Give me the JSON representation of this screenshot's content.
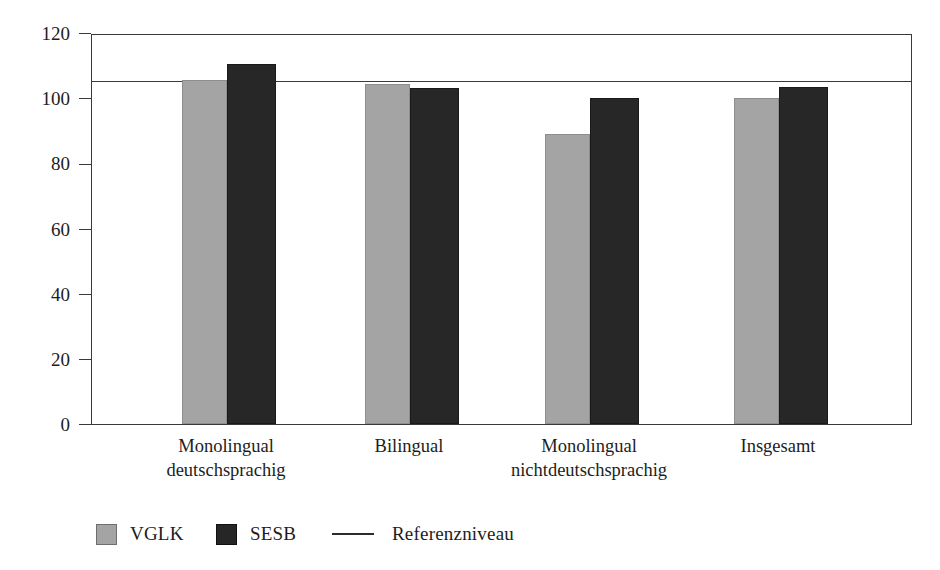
{
  "chart_data": {
    "type": "bar",
    "title": "",
    "xlabel": "",
    "ylabel": "Mathematikleistung",
    "ylim": [
      0,
      120
    ],
    "yticks": [
      0,
      20,
      40,
      60,
      80,
      100,
      120
    ],
    "ytick_labels": [
      "0",
      "20",
      "40",
      "60",
      "80",
      "100",
      "120"
    ],
    "grid": false,
    "legend_position": "bottom-left",
    "categories": [
      "Monolingual deutschsprachig",
      "Bilingual",
      "Monolingual nichtdeutschsprachig",
      "Insgesamt"
    ],
    "category_lines": [
      [
        "Monolingual",
        "deutschsprachig"
      ],
      [
        "Bilingual",
        ""
      ],
      [
        "Monolingual",
        "nichtdeutschsprachig"
      ],
      [
        "Insgesamt",
        ""
      ]
    ],
    "series": [
      {
        "name": "VGLK",
        "color": "#a4a4a4",
        "values": [
          105.5,
          104.5,
          89.0,
          100.0
        ]
      },
      {
        "name": "SESB",
        "color": "#272727",
        "values": [
          110.5,
          103.0,
          100.0,
          103.5
        ]
      }
    ],
    "reference_line": {
      "label": "Referenzniveau",
      "value": 105.5,
      "color": "#3a3a3a"
    }
  },
  "legend": {
    "items": [
      {
        "label": "VGLK",
        "marker": "swatch-gray"
      },
      {
        "label": "SESB",
        "marker": "swatch-black"
      },
      {
        "label": "Referenzniveau",
        "marker": "line"
      }
    ]
  },
  "axis": {
    "y_title": "Mathematikleistung"
  }
}
